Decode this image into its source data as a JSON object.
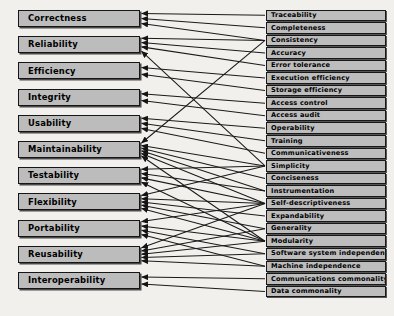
{
  "diagram": {
    "type": "bipartite-mapping",
    "colors": {
      "background": "#f2f0ed",
      "box_fill": "#bcbcbc",
      "box_border": "#161616",
      "edge": "#1a1a1a",
      "text": "#000000"
    },
    "factors": [
      {
        "label": "Correctness"
      },
      {
        "label": "Reliability"
      },
      {
        "label": "Efficiency"
      },
      {
        "label": "Integrity"
      },
      {
        "label": "Usability"
      },
      {
        "label": "Maintainability"
      },
      {
        "label": "Testability"
      },
      {
        "label": "Flexibility"
      },
      {
        "label": "Portability"
      },
      {
        "label": "Reusability"
      },
      {
        "label": "Interoperability"
      }
    ],
    "criteria": [
      {
        "label": "Traceability"
      },
      {
        "label": "Completeness"
      },
      {
        "label": "Consistency"
      },
      {
        "label": "Accuracy"
      },
      {
        "label": "Error tolerance"
      },
      {
        "label": "Execution efficiency"
      },
      {
        "label": "Storage efficiency"
      },
      {
        "label": "Access control"
      },
      {
        "label": "Access audit"
      },
      {
        "label": "Operability"
      },
      {
        "label": "Training"
      },
      {
        "label": "Communicativeness"
      },
      {
        "label": "Simplicity"
      },
      {
        "label": "Conciseness"
      },
      {
        "label": "Instrumentation"
      },
      {
        "label": "Self-descriptiveness"
      },
      {
        "label": "Expandability"
      },
      {
        "label": "Generality"
      },
      {
        "label": "Modularity"
      },
      {
        "label": "Software system independence"
      },
      {
        "label": "Machine independence"
      },
      {
        "label": "Communications commonality"
      },
      {
        "label": "Data commonality"
      }
    ],
    "edges": [
      {
        "factor": 0,
        "criterion": 0
      },
      {
        "factor": 0,
        "criterion": 1
      },
      {
        "factor": 0,
        "criterion": 2
      },
      {
        "factor": 1,
        "criterion": 3
      },
      {
        "factor": 1,
        "criterion": 4
      },
      {
        "factor": 1,
        "criterion": 2
      },
      {
        "factor": 1,
        "criterion": 12
      },
      {
        "factor": 2,
        "criterion": 5
      },
      {
        "factor": 2,
        "criterion": 6
      },
      {
        "factor": 3,
        "criterion": 7
      },
      {
        "factor": 3,
        "criterion": 8
      },
      {
        "factor": 4,
        "criterion": 9
      },
      {
        "factor": 4,
        "criterion": 10
      },
      {
        "factor": 4,
        "criterion": 11
      },
      {
        "factor": 5,
        "criterion": 2
      },
      {
        "factor": 5,
        "criterion": 12
      },
      {
        "factor": 5,
        "criterion": 13
      },
      {
        "factor": 5,
        "criterion": 14
      },
      {
        "factor": 5,
        "criterion": 15
      },
      {
        "factor": 5,
        "criterion": 18
      },
      {
        "factor": 6,
        "criterion": 12
      },
      {
        "factor": 6,
        "criterion": 14
      },
      {
        "factor": 6,
        "criterion": 15
      },
      {
        "factor": 6,
        "criterion": 18
      },
      {
        "factor": 7,
        "criterion": 12
      },
      {
        "factor": 7,
        "criterion": 16
      },
      {
        "factor": 7,
        "criterion": 17
      },
      {
        "factor": 7,
        "criterion": 15
      },
      {
        "factor": 7,
        "criterion": 18
      },
      {
        "factor": 8,
        "criterion": 19
      },
      {
        "factor": 8,
        "criterion": 20
      },
      {
        "factor": 8,
        "criterion": 15
      },
      {
        "factor": 8,
        "criterion": 18
      },
      {
        "factor": 9,
        "criterion": 17
      },
      {
        "factor": 9,
        "criterion": 18
      },
      {
        "factor": 9,
        "criterion": 19
      },
      {
        "factor": 9,
        "criterion": 20
      },
      {
        "factor": 9,
        "criterion": 15
      },
      {
        "factor": 10,
        "criterion": 21
      },
      {
        "factor": 10,
        "criterion": 22
      }
    ]
  }
}
